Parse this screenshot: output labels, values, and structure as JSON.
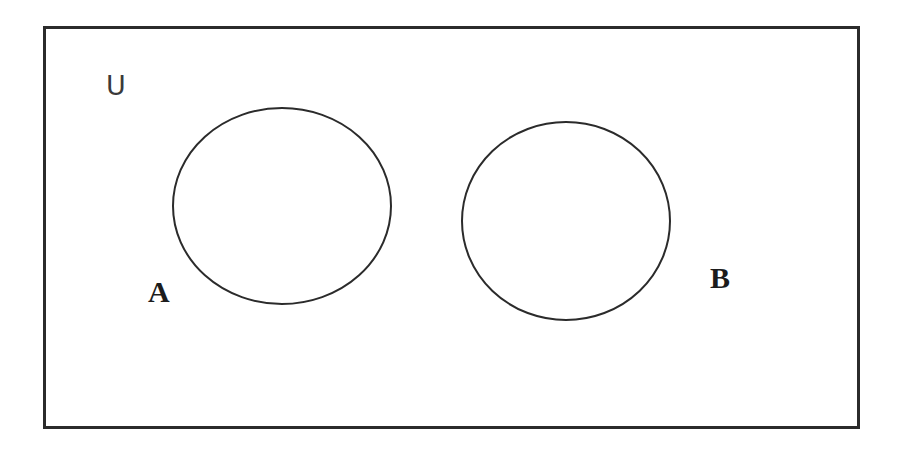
{
  "figure": {
    "kind": "venn-diagram",
    "background_color": "#ffffff",
    "stroke_color": "#2b2b2b",
    "canvas": {
      "width": 902,
      "height": 449
    }
  },
  "universe": {
    "label": "U",
    "rect": {
      "x": 44,
      "y": 27,
      "width": 814,
      "height": 400
    },
    "stroke_width": 3,
    "fill": "none",
    "label_position": {
      "x": 106,
      "y": 72
    }
  },
  "sets": [
    {
      "id": "A",
      "label": "A",
      "shape": "ellipse",
      "cx": 282,
      "cy": 206,
      "rx": 109,
      "ry": 98,
      "stroke_width": 2,
      "fill": "none",
      "label_position": {
        "x": 148,
        "y": 277
      }
    },
    {
      "id": "B",
      "label": "B",
      "shape": "ellipse",
      "cx": 566,
      "cy": 221,
      "rx": 104,
      "ry": 99,
      "stroke_width": 2,
      "fill": "none",
      "label_position": {
        "x": 710,
        "y": 263
      }
    }
  ],
  "relationship": {
    "intersection": "empty",
    "note": "A and B are disjoint"
  }
}
